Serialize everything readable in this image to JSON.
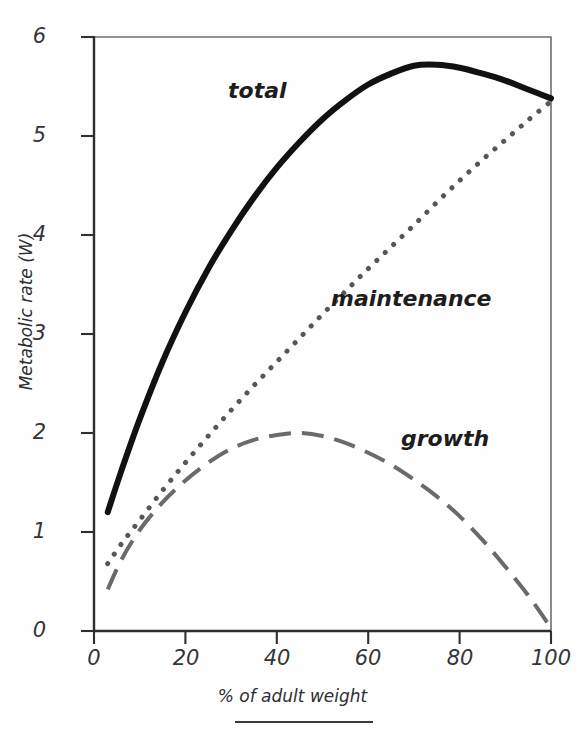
{
  "figure": {
    "background_color": "#fefefe",
    "axis_color": "#3a3a3a",
    "footer_rule": true
  },
  "axes": {
    "x_title": "% of adult weight",
    "y_title": "Metabolic rate (W)",
    "x_ticks": [
      "0",
      "20",
      "40",
      "60",
      "80",
      "100"
    ],
    "y_ticks": [
      "0",
      "1",
      "2",
      "3",
      "4",
      "5",
      "6"
    ]
  },
  "series_labels": {
    "total": "total",
    "maintenance": "maintenance",
    "growth": "growth"
  },
  "chart_data": {
    "type": "line",
    "title": "",
    "subtitle": "",
    "xlabel": "% of adult weight",
    "ylabel": "Metabolic rate (W)",
    "xlim": [
      0,
      103
    ],
    "ylim": [
      0,
      6
    ],
    "xticks": [
      0,
      20,
      40,
      60,
      80,
      100
    ],
    "yticks": [
      0,
      1,
      2,
      3,
      4,
      5,
      6
    ],
    "grid": false,
    "legend": "inline-annotations",
    "annotations": [
      {
        "text": "total",
        "x": 28,
        "y": 5.25
      },
      {
        "text": "maintenance",
        "x": 57,
        "y": 3.3
      },
      {
        "text": "growth",
        "x": 71,
        "y": 2.0
      }
    ],
    "series": [
      {
        "name": "total",
        "style": "solid",
        "color": "#111111",
        "width": 6,
        "x": [
          3,
          6,
          10,
          15,
          20,
          25,
          30,
          35,
          40,
          45,
          50,
          55,
          60,
          65,
          70,
          75,
          80,
          85,
          90,
          95,
          100
        ],
        "values": [
          1.2,
          1.62,
          2.14,
          2.72,
          3.22,
          3.66,
          4.04,
          4.38,
          4.68,
          4.94,
          5.17,
          5.36,
          5.52,
          5.63,
          5.71,
          5.72,
          5.69,
          5.63,
          5.56,
          5.47,
          5.38
        ]
      },
      {
        "name": "maintenance",
        "style": "dotted",
        "color": "#565656",
        "width": 5,
        "x": [
          3,
          6,
          10,
          15,
          20,
          25,
          30,
          35,
          40,
          45,
          50,
          55,
          60,
          65,
          70,
          75,
          80,
          85,
          90,
          95,
          100
        ],
        "values": [
          0.68,
          0.88,
          1.12,
          1.42,
          1.7,
          1.97,
          2.23,
          2.48,
          2.72,
          2.96,
          3.2,
          3.43,
          3.66,
          3.88,
          4.1,
          4.33,
          4.55,
          4.76,
          4.96,
          5.16,
          5.35
        ]
      },
      {
        "name": "growth",
        "style": "dashed",
        "color": "#6a6a6a",
        "width": 4,
        "x": [
          3,
          6,
          10,
          15,
          20,
          25,
          30,
          35,
          40,
          45,
          50,
          55,
          60,
          65,
          70,
          75,
          80,
          85,
          90,
          95,
          100
        ],
        "values": [
          0.42,
          0.72,
          1.02,
          1.3,
          1.52,
          1.7,
          1.84,
          1.93,
          1.98,
          2.0,
          1.97,
          1.9,
          1.8,
          1.68,
          1.53,
          1.36,
          1.16,
          0.92,
          0.65,
          0.36,
          0.03
        ]
      }
    ]
  }
}
